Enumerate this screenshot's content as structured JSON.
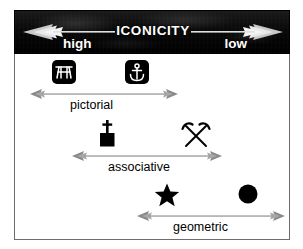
{
  "figure": {
    "header": {
      "title": "ICONICITY",
      "left_label": "high",
      "right_label": "low",
      "background_color": "#000000",
      "text_color": "#ffffff",
      "arrow_direction": "double"
    },
    "rows": [
      {
        "label": "pictorial",
        "symbols": [
          {
            "name": "picnic-table-symbol",
            "style": "white-on-black-rounded-square"
          },
          {
            "name": "anchor-symbol",
            "style": "white-on-black-rounded-square"
          }
        ],
        "axis_color": "#808080"
      },
      {
        "label": "associative",
        "symbols": [
          {
            "name": "church-symbol",
            "style": "solid-black-glyph"
          },
          {
            "name": "crossed-hammers-symbol",
            "style": "solid-black-glyph"
          }
        ],
        "axis_color": "#808080"
      },
      {
        "label": "geometric",
        "symbols": [
          {
            "name": "star-symbol",
            "style": "solid-black-glyph"
          },
          {
            "name": "filled-circle-symbol",
            "style": "solid-black-glyph"
          }
        ],
        "axis_color": "#808080"
      }
    ],
    "frame_color": "#6e6e6e",
    "background_color": "#ffffff"
  }
}
